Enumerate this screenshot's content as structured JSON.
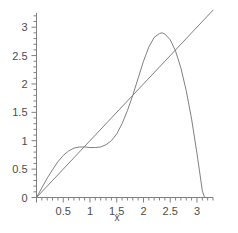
{
  "chart_data": {
    "type": "line",
    "title": "",
    "subtitle": "",
    "xlabel": "x",
    "ylabel": "",
    "grid": false,
    "legend": "none",
    "xlim": [
      0,
      3.3
    ],
    "ylim": [
      0,
      3.25
    ],
    "xticks": [
      0,
      0.5,
      1,
      1.5,
      2,
      2.5,
      3
    ],
    "xtick_labels": [
      "0",
      "0.5",
      "1",
      "1.5",
      "2",
      "2.5",
      "3"
    ],
    "yticks": [
      0,
      0.5,
      1,
      1.5,
      2,
      2.5,
      3
    ],
    "ytick_labels": [
      "0",
      "0.5",
      "1",
      "1.5",
      "2",
      "2.5",
      "3"
    ],
    "minor_tick_step": 0.1,
    "line_color": "#808080",
    "axis_color": "#808080",
    "text_color": "#4d4d4d",
    "background": "#ffffff",
    "series": [
      {
        "name": "identity-line",
        "type": "line",
        "x": [
          0,
          3.3
        ],
        "y": [
          0,
          3.3
        ]
      },
      {
        "name": "curve",
        "type": "line",
        "x": [
          0.0,
          0.1,
          0.2,
          0.3,
          0.4,
          0.5,
          0.6,
          0.7,
          0.8,
          0.9,
          1.0,
          1.1,
          1.2,
          1.3,
          1.4,
          1.5,
          1.6,
          1.7,
          1.8,
          1.9,
          2.0,
          2.1,
          2.2,
          2.3,
          2.35,
          2.4,
          2.5,
          2.6,
          2.7,
          2.8,
          2.9,
          3.0,
          3.05,
          3.1,
          3.1416
        ],
        "y": [
          0.0,
          0.17,
          0.34,
          0.49,
          0.63,
          0.74,
          0.82,
          0.87,
          0.89,
          0.89,
          0.88,
          0.88,
          0.89,
          0.93,
          1.0,
          1.12,
          1.3,
          1.53,
          1.8,
          2.1,
          2.4,
          2.65,
          2.82,
          2.89,
          2.9,
          2.88,
          2.78,
          2.58,
          2.28,
          1.88,
          1.38,
          0.78,
          0.45,
          0.12,
          0.0
        ]
      }
    ],
    "annotations": [
      {
        "name": "local-maximum",
        "x": 0.8,
        "y": 0.89
      },
      {
        "name": "global-maximum",
        "x": 2.35,
        "y": 2.9
      },
      {
        "name": "zero-crossing-right",
        "x": 3.1416,
        "y": 0.0
      }
    ]
  },
  "axes": {
    "x_axis_label": "x",
    "origin_label": "0"
  }
}
